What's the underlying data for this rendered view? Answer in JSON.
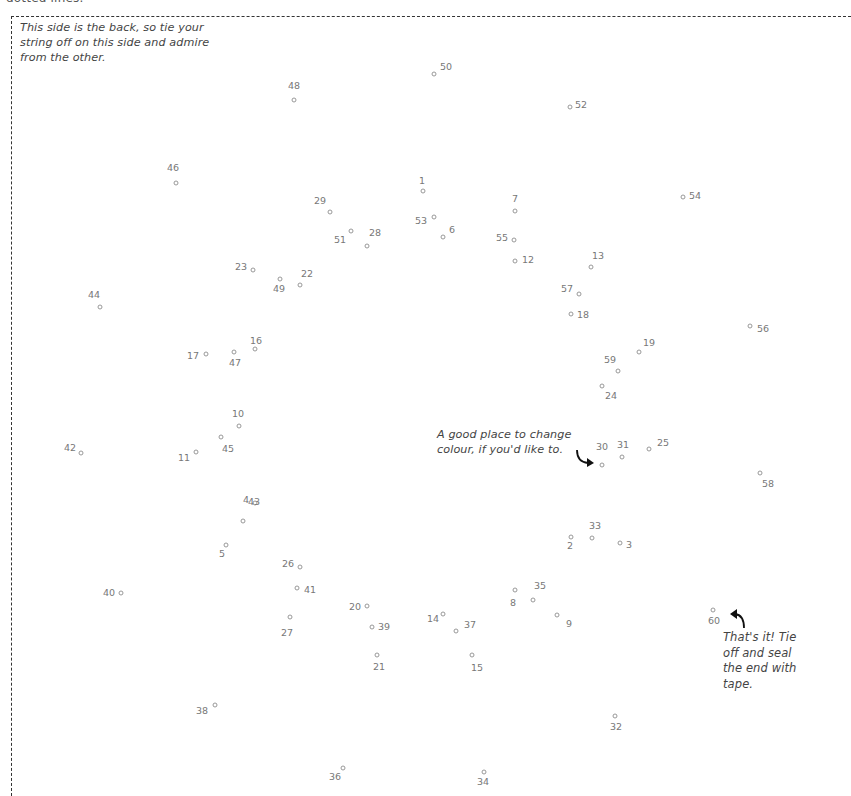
{
  "header": {
    "cut_off_text": "dotted lines."
  },
  "notes": {
    "back_side": [
      "This side is the back, so tie your",
      "string off on this side and admire",
      "from the other."
    ],
    "change_colour": [
      "A good place to change",
      "colour, if you'd like to."
    ],
    "finish": [
      "That's it! Tie",
      "off and seal",
      "the end with",
      "tape."
    ]
  },
  "points": [
    {
      "n": "1",
      "x": 423,
      "y": 191,
      "lx": 419,
      "ly": 175
    },
    {
      "n": "2",
      "x": 571,
      "y": 537,
      "lx": 567,
      "ly": 540
    },
    {
      "n": "3",
      "x": 620,
      "y": 543,
      "lx": 626,
      "ly": 539
    },
    {
      "n": "4",
      "x": 255,
      "y": 503,
      "lx": 243,
      "ly": 494
    },
    {
      "n": "5",
      "x": 226,
      "y": 545,
      "lx": 219,
      "ly": 548
    },
    {
      "n": "6",
      "x": 443,
      "y": 237,
      "lx": 449,
      "ly": 224
    },
    {
      "n": "7",
      "x": 515,
      "y": 211,
      "lx": 512,
      "ly": 193
    },
    {
      "n": "8",
      "x": 515,
      "y": 590,
      "lx": 510,
      "ly": 597
    },
    {
      "n": "9",
      "x": 557,
      "y": 615,
      "lx": 566,
      "ly": 618
    },
    {
      "n": "10",
      "x": 239,
      "y": 426,
      "lx": 232,
      "ly": 408
    },
    {
      "n": "11",
      "x": 196,
      "y": 452,
      "lx": 178,
      "ly": 452
    },
    {
      "n": "12",
      "x": 515,
      "y": 261,
      "lx": 522,
      "ly": 254
    },
    {
      "n": "13",
      "x": 591,
      "y": 267,
      "lx": 592,
      "ly": 250
    },
    {
      "n": "14",
      "x": 443,
      "y": 614,
      "lx": 427,
      "ly": 613
    },
    {
      "n": "15",
      "x": 472,
      "y": 655,
      "lx": 471,
      "ly": 662
    },
    {
      "n": "16",
      "x": 255,
      "y": 349,
      "lx": 250,
      "ly": 335
    },
    {
      "n": "17",
      "x": 206,
      "y": 354,
      "lx": 187,
      "ly": 350
    },
    {
      "n": "18",
      "x": 571,
      "y": 314,
      "lx": 577,
      "ly": 309
    },
    {
      "n": "19",
      "x": 639,
      "y": 352,
      "lx": 643,
      "ly": 337
    },
    {
      "n": "20",
      "x": 367,
      "y": 606,
      "lx": 349,
      "ly": 601
    },
    {
      "n": "21",
      "x": 377,
      "y": 655,
      "lx": 373,
      "ly": 661
    },
    {
      "n": "22",
      "x": 300,
      "y": 285,
      "lx": 301,
      "ly": 268
    },
    {
      "n": "23",
      "x": 253,
      "y": 270,
      "lx": 235,
      "ly": 261
    },
    {
      "n": "24",
      "x": 602,
      "y": 386,
      "lx": 605,
      "ly": 390
    },
    {
      "n": "25",
      "x": 649,
      "y": 449,
      "lx": 657,
      "ly": 437
    },
    {
      "n": "26",
      "x": 300,
      "y": 567,
      "lx": 282,
      "ly": 558
    },
    {
      "n": "27",
      "x": 290,
      "y": 617,
      "lx": 281,
      "ly": 627
    },
    {
      "n": "28",
      "x": 367,
      "y": 246,
      "lx": 369,
      "ly": 227
    },
    {
      "n": "29",
      "x": 330,
      "y": 212,
      "lx": 314,
      "ly": 195
    },
    {
      "n": "30",
      "x": 602,
      "y": 465,
      "lx": 596,
      "ly": 441
    },
    {
      "n": "31",
      "x": 622,
      "y": 457,
      "lx": 617,
      "ly": 439
    },
    {
      "n": "32",
      "x": 615,
      "y": 716,
      "lx": 610,
      "ly": 721
    },
    {
      "n": "33",
      "x": 592,
      "y": 538,
      "lx": 589,
      "ly": 520
    },
    {
      "n": "34",
      "x": 484,
      "y": 772,
      "lx": 477,
      "ly": 776
    },
    {
      "n": "35",
      "x": 533,
      "y": 600,
      "lx": 534,
      "ly": 580
    },
    {
      "n": "36",
      "x": 343,
      "y": 768,
      "lx": 329,
      "ly": 771
    },
    {
      "n": "37",
      "x": 456,
      "y": 631,
      "lx": 464,
      "ly": 619
    },
    {
      "n": "38",
      "x": 215,
      "y": 705,
      "lx": 196,
      "ly": 705
    },
    {
      "n": "39",
      "x": 372,
      "y": 627,
      "lx": 378,
      "ly": 621
    },
    {
      "n": "40",
      "x": 121,
      "y": 593,
      "lx": 103,
      "ly": 587
    },
    {
      "n": "41",
      "x": 297,
      "y": 588,
      "lx": 304,
      "ly": 584
    },
    {
      "n": "42",
      "x": 81,
      "y": 453,
      "lx": 64,
      "ly": 442
    },
    {
      "n": "43",
      "x": 243,
      "y": 521,
      "lx": 248,
      "ly": 496
    },
    {
      "n": "44",
      "x": 100,
      "y": 307,
      "lx": 88,
      "ly": 289
    },
    {
      "n": "45",
      "x": 221,
      "y": 437,
      "lx": 222,
      "ly": 443
    },
    {
      "n": "46",
      "x": 176,
      "y": 183,
      "lx": 167,
      "ly": 162
    },
    {
      "n": "47",
      "x": 234,
      "y": 352,
      "lx": 229,
      "ly": 357
    },
    {
      "n": "48",
      "x": 294,
      "y": 100,
      "lx": 288,
      "ly": 80
    },
    {
      "n": "49",
      "x": 280,
      "y": 279,
      "lx": 273,
      "ly": 283
    },
    {
      "n": "50",
      "x": 434,
      "y": 74,
      "lx": 440,
      "ly": 61
    },
    {
      "n": "51",
      "x": 351,
      "y": 231,
      "lx": 334,
      "ly": 234
    },
    {
      "n": "52",
      "x": 570,
      "y": 107,
      "lx": 575,
      "ly": 99
    },
    {
      "n": "53",
      "x": 434,
      "y": 217,
      "lx": 415,
      "ly": 215
    },
    {
      "n": "54",
      "x": 683,
      "y": 197,
      "lx": 689,
      "ly": 190
    },
    {
      "n": "55",
      "x": 514,
      "y": 240,
      "lx": 496,
      "ly": 232
    },
    {
      "n": "56",
      "x": 750,
      "y": 326,
      "lx": 757,
      "ly": 323
    },
    {
      "n": "57",
      "x": 579,
      "y": 294,
      "lx": 561,
      "ly": 283
    },
    {
      "n": "58",
      "x": 760,
      "y": 473,
      "lx": 762,
      "ly": 478
    },
    {
      "n": "59",
      "x": 618,
      "y": 371,
      "lx": 604,
      "ly": 354
    },
    {
      "n": "60",
      "x": 713,
      "y": 610,
      "lx": 708,
      "ly": 615
    }
  ]
}
